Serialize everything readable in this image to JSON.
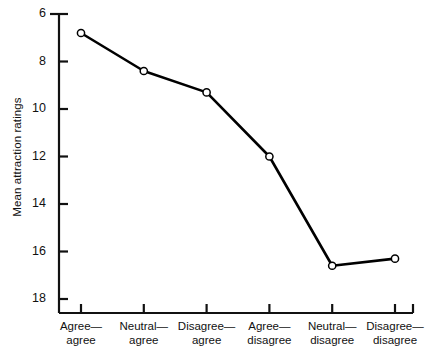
{
  "chart_data": {
    "type": "line",
    "title": "",
    "xlabel": "",
    "ylabel": "Mean attraction ratings",
    "categories": [
      "Agree—agree",
      "Neutral—agree",
      "Disagree—agree",
      "Agree—disagree",
      "Neutral—disagree",
      "Disagree—disagree"
    ],
    "category_lines": [
      [
        "Agree—",
        "agree"
      ],
      [
        "Neutral—",
        "agree"
      ],
      [
        "Disagree—",
        "agree"
      ],
      [
        "Agree—",
        "disagree"
      ],
      [
        "Neutral—",
        "disagree"
      ],
      [
        "Disagree—",
        "disagree"
      ]
    ],
    "values": [
      6.8,
      8.4,
      9.3,
      12.0,
      16.6,
      16.3
    ],
    "ylim": [
      6,
      18
    ],
    "y_inverted": true,
    "yticks": [
      6,
      8,
      10,
      12,
      14,
      16,
      18
    ],
    "ytick_labels": [
      "6",
      "8",
      "10",
      "12",
      "14",
      "16",
      "18"
    ],
    "grid": false,
    "legend": null,
    "marker": "open-circle",
    "line_color": "#000000",
    "marker_fill": "#ffffff",
    "marker_stroke": "#000000"
  },
  "axis": {
    "y_title": "Mean attraction ratings",
    "tick_labels_y": [
      "6",
      "8",
      "10",
      "12",
      "14",
      "16",
      "18"
    ]
  }
}
